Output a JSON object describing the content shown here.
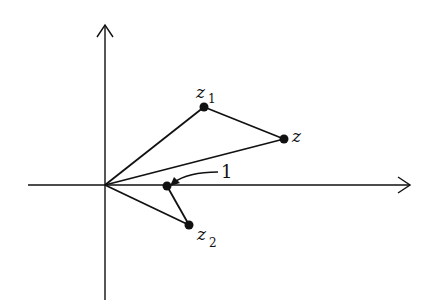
{
  "diagram": {
    "type": "complex-plane-vector-diagram",
    "background": "#ffffff",
    "stroke_color": "#111111",
    "axes": {
      "origin": [
        105,
        185
      ],
      "x_axis": {
        "from": [
          28,
          185
        ],
        "to": [
          410,
          185
        ],
        "arrow": true
      },
      "y_axis": {
        "from": [
          105,
          300
        ],
        "to": [
          105,
          25
        ],
        "arrow": true
      }
    },
    "points": [
      {
        "id": "z1",
        "label": "z",
        "subscript": "1",
        "pos": [
          204,
          107
        ]
      },
      {
        "id": "z",
        "label": "z",
        "subscript": "",
        "pos": [
          284,
          139
        ]
      },
      {
        "id": "one",
        "label": "1",
        "subscript": "",
        "pos": [
          167,
          186
        ]
      },
      {
        "id": "z2",
        "label": "z",
        "subscript": "2",
        "pos": [
          189,
          225
        ]
      }
    ],
    "labels": {
      "z1_main": "z",
      "z1_sub": "1",
      "z_main": "z",
      "one": "1",
      "z2_main": "z",
      "z2_sub": "2"
    },
    "segments": [
      {
        "from": "origin",
        "to": "z1"
      },
      {
        "from": "z1",
        "to": "z"
      },
      {
        "from": "origin",
        "to": "z"
      },
      {
        "from": "origin",
        "to": "z2"
      },
      {
        "from": "z2",
        "to": "one"
      }
    ],
    "annotation": {
      "text": "1",
      "arrow_from": [
        218,
        172
      ],
      "arrow_to": [
        172,
        183
      ]
    }
  }
}
